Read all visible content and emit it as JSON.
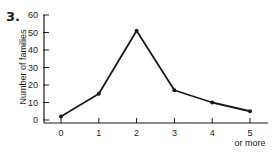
{
  "figure": {
    "number": "3."
  },
  "chart_data": {
    "type": "line",
    "title": "",
    "xlabel": "",
    "ylabel": "Number of families",
    "categories": [
      "0",
      "1",
      "2",
      "3",
      "4",
      "5\nor more"
    ],
    "x_tick_labels": [
      "0",
      "1",
      "2",
      "3",
      "4",
      "5"
    ],
    "x_tick_sublabel": "or more",
    "series": [
      {
        "name": "Number of families",
        "values": [
          2,
          15,
          51,
          17,
          10,
          5
        ]
      }
    ],
    "y_ticks": [
      0,
      10,
      20,
      30,
      40,
      50,
      60
    ],
    "ylim": [
      0,
      60
    ],
    "grid": false,
    "legend": "none"
  }
}
